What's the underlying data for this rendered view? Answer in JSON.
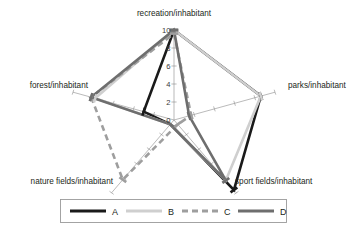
{
  "chart_data": {
    "type": "radar",
    "title": "",
    "categories": [
      "recreation/inhabitant",
      "parks/inhabitant",
      "sport fields/inhabitant",
      "nature fields/inhabitant",
      "forest/inhabitant"
    ],
    "tick_labels": [
      "0",
      "2",
      "4",
      "6",
      "8",
      "10"
    ],
    "tick_values": [
      0,
      2,
      4,
      6,
      8,
      10
    ],
    "rlim": [
      0,
      10
    ],
    "grid": false,
    "legend_position": "bottom",
    "series": [
      {
        "name": "A",
        "color": "#1a1a1a",
        "style": "solid",
        "width": 2.6,
        "values": [
          10.0,
          8.6,
          9.6,
          0.6,
          3.0
        ]
      },
      {
        "name": "B",
        "color": "#cfcfcf",
        "style": "solid",
        "width": 2.6,
        "values": [
          10.0,
          8.6,
          8.3,
          0.6,
          7.8
        ]
      },
      {
        "name": "C",
        "color": "#9e9e9e",
        "style": "dashed",
        "width": 2.6,
        "values": [
          9.6,
          1.7,
          0.6,
          8.2,
          8.2
        ]
      },
      {
        "name": "D",
        "color": "#6e6e6e",
        "style": "solid",
        "width": 2.6,
        "values": [
          10.0,
          1.5,
          8.3,
          0.6,
          8.2
        ]
      }
    ]
  },
  "legend": {
    "entries": [
      {
        "label": "A"
      },
      {
        "label": "B"
      },
      {
        "label": "C"
      },
      {
        "label": "D"
      }
    ]
  },
  "axis_labels": {
    "recreation": "recreation/inhabitant",
    "parks": "parks/inhabitant",
    "sport_fields": "sport fields/inhabitant",
    "nature_fields": "nature fields/inhabitant",
    "forest": "forest/inhabitant"
  },
  "ticks": {
    "t0": "0",
    "t2": "2",
    "t4": "4",
    "t6": "6",
    "t8": "8",
    "t10": "10"
  }
}
